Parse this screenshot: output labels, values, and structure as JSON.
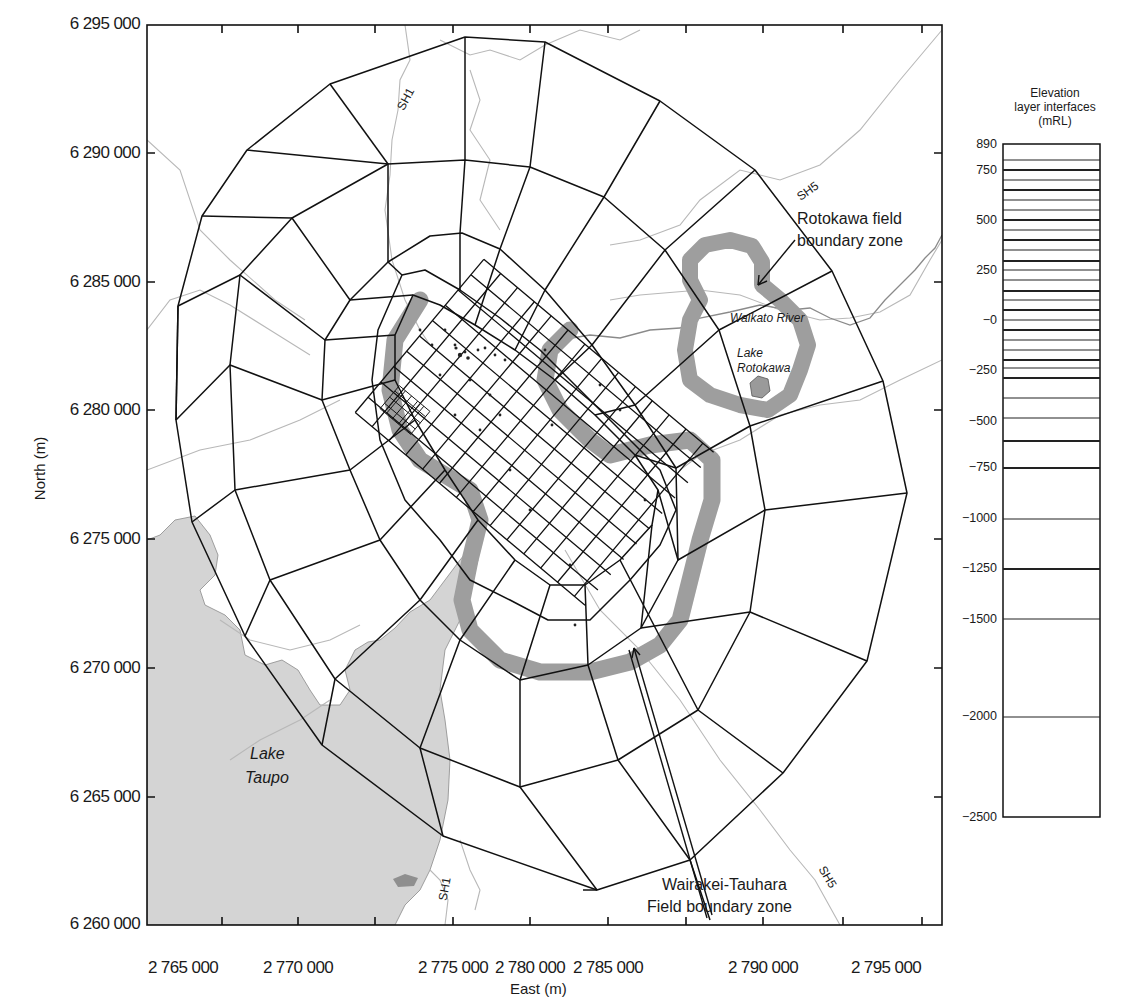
{
  "map": {
    "x_axis": {
      "title": "East (m)",
      "ticks": [
        "2 765 000",
        "2 770 000",
        "2 775 000",
        "2 780 000",
        "2 785 000",
        "2 790 000",
        "2 795 000"
      ]
    },
    "y_axis": {
      "title": "North (m)",
      "ticks": [
        "6 295 000",
        "6 290 000",
        "6 285 000",
        "6 280 000",
        "6 275 000",
        "6 270 000",
        "6 265 000",
        "6 260 000"
      ]
    },
    "labels": {
      "lake_taupo_line1": "Lake",
      "lake_taupo_line2": "Taupo",
      "lake_rotokawa_line1": "Lake",
      "lake_rotokawa_line2": "Rotokawa",
      "waikato_river": "Waikato River",
      "sh1_north": "SH1",
      "sh1_south": "SH1",
      "sh5_north": "SH5",
      "sh5_south": "SH5",
      "rotokawa_zone_line1": "Rotokawa field",
      "rotokawa_zone_line2": "boundary zone",
      "wairakei_zone_line1": "Wairakei-Tauhara",
      "wairakei_zone_line2": "Field boundary zone"
    },
    "colors": {
      "lake_fill": "#d2d2d2",
      "boundary_zone_fill": "#9e9e9e",
      "grid_line": "#111111",
      "road_river_line": "#b5b5b5"
    }
  },
  "elevation_column": {
    "title_line1": "Elevation",
    "title_line2": "layer interfaces",
    "title_line3": "(mRL)",
    "tick_labels": [
      "890",
      "750",
      "500",
      "250",
      "−0",
      "−250",
      "−500",
      "−750",
      "−1000",
      "−1250",
      "−1500",
      "−2000",
      "−2500"
    ]
  },
  "chart_data": {
    "type": "table",
    "title": "Elevation layer interfaces (mRL)",
    "layer_interfaces_mRL": [
      890,
      800,
      750,
      700,
      650,
      600,
      550,
      500,
      450,
      400,
      350,
      300,
      250,
      200,
      150,
      100,
      50,
      0,
      -50,
      -100,
      -150,
      -200,
      -250,
      -300,
      -400,
      -500,
      -625,
      -750,
      -1000,
      -1250,
      -1500,
      -2000,
      -2500
    ],
    "labeled_ticks": [
      890,
      750,
      500,
      250,
      0,
      -250,
      -500,
      -750,
      -1000,
      -1250,
      -1500,
      -2000,
      -2500
    ],
    "map_extent": {
      "east_m": [
        2765000,
        2797000
      ],
      "north_m": [
        6260000,
        6295000
      ]
    }
  }
}
